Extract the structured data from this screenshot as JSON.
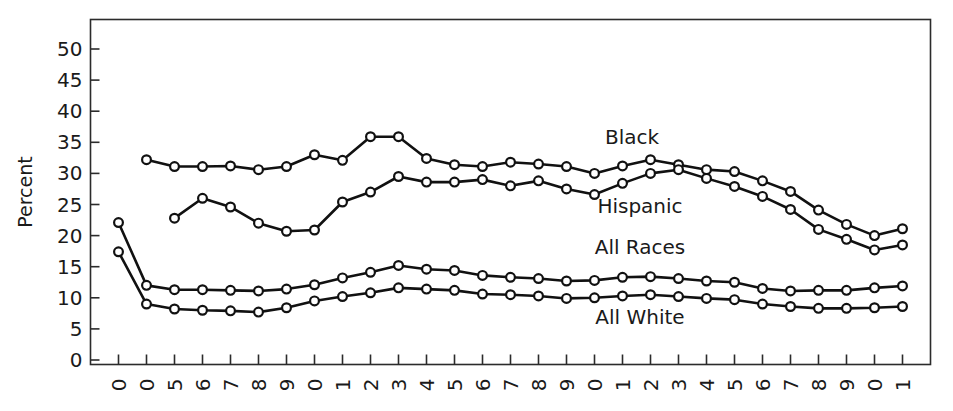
{
  "chart_data": {
    "type": "line",
    "title": "",
    "subtitle": "",
    "xlabel": "",
    "ylabel": "Percent",
    "ylim": [
      0,
      50
    ],
    "yticks": [
      0,
      5,
      10,
      15,
      20,
      25,
      30,
      35,
      40,
      45,
      50
    ],
    "ytick_labels": [
      "0",
      "5",
      "10",
      "15",
      "20",
      "25",
      "30",
      "35",
      "40",
      "45",
      "50"
    ],
    "grid": false,
    "legend_position": "inline-annotations",
    "marker": "open-circle",
    "line_color": "#111111",
    "marker_fill": "#ffffff",
    "x": [
      1959,
      1960,
      1965,
      1966,
      1967,
      1968,
      1969,
      1970,
      1971,
      1972,
      1973,
      1974,
      1975,
      1976,
      1977,
      1978,
      1979,
      1980,
      1981,
      1982,
      1983,
      1984,
      1985,
      1986,
      1987,
      1988,
      1989,
      1990,
      1991
    ],
    "xtick_labels": [
      "0",
      "0",
      "5",
      "6",
      "7",
      "8",
      "9",
      "0",
      "1",
      "2",
      "3",
      "4",
      "5",
      "6",
      "7",
      "8",
      "9",
      "0",
      "1",
      "2",
      "3",
      "4",
      "5",
      "6",
      "7",
      "8",
      "9",
      "0",
      "1"
    ],
    "series": [
      {
        "name": "Black",
        "label": "Black",
        "x": [
          1960,
          1965,
          1966,
          1967,
          1968,
          1969,
          1970,
          1971,
          1972,
          1973,
          1974,
          1975,
          1976,
          1977,
          1978,
          1979,
          1980,
          1981,
          1982,
          1983,
          1984,
          1985,
          1986,
          1987,
          1988,
          1989,
          1990,
          1991
        ],
        "values": [
          32.2,
          31.1,
          31.1,
          31.2,
          30.6,
          31.1,
          33.0,
          32.1,
          35.9,
          35.9,
          32.4,
          31.4,
          31.1,
          31.8,
          31.5,
          31.1,
          30.0,
          31.2,
          32.2,
          31.4,
          30.6,
          30.3,
          28.8,
          27.1,
          24.1,
          21.8,
          20.0,
          21.1
        ]
      },
      {
        "name": "Hispanic",
        "label": "Hispanic",
        "x": [
          1965,
          1966,
          1967,
          1968,
          1969,
          1970,
          1971,
          1972,
          1973,
          1974,
          1975,
          1976,
          1977,
          1978,
          1979,
          1980,
          1981,
          1982,
          1983,
          1984,
          1985,
          1986,
          1987,
          1988,
          1989,
          1990,
          1991
        ],
        "values": [
          22.8,
          26.0,
          24.6,
          22.0,
          20.7,
          20.9,
          25.4,
          27.0,
          29.5,
          28.6,
          28.6,
          29.0,
          28.0,
          28.8,
          27.5,
          26.6,
          28.4,
          30.0,
          30.6,
          29.2,
          27.9,
          26.3,
          24.2,
          21.0,
          19.4,
          17.7,
          18.5
        ]
      },
      {
        "name": "All Races",
        "label": "All Races",
        "x": [
          1959,
          1960,
          1965,
          1966,
          1967,
          1968,
          1969,
          1970,
          1971,
          1972,
          1973,
          1974,
          1975,
          1976,
          1977,
          1978,
          1979,
          1980,
          1981,
          1982,
          1983,
          1984,
          1985,
          1986,
          1987,
          1988,
          1989,
          1990,
          1991
        ],
        "values": [
          22.1,
          12.0,
          11.3,
          11.3,
          11.2,
          11.1,
          11.4,
          12.1,
          13.2,
          14.1,
          15.2,
          14.6,
          14.4,
          13.6,
          13.3,
          13.1,
          12.7,
          12.8,
          13.3,
          13.4,
          13.1,
          12.7,
          12.5,
          11.5,
          11.1,
          11.2,
          11.2,
          11.6,
          11.9
        ]
      },
      {
        "name": "All White",
        "label": "All White",
        "x": [
          1959,
          1960,
          1965,
          1966,
          1967,
          1968,
          1969,
          1970,
          1971,
          1972,
          1973,
          1974,
          1975,
          1976,
          1977,
          1978,
          1979,
          1980,
          1981,
          1982,
          1983,
          1984,
          1985,
          1986,
          1987,
          1988,
          1989,
          1990,
          1991
        ],
        "values": [
          17.4,
          9.0,
          8.2,
          8.0,
          7.9,
          7.7,
          8.4,
          9.5,
          10.2,
          10.8,
          11.6,
          11.4,
          11.2,
          10.6,
          10.5,
          10.3,
          9.9,
          10.0,
          10.3,
          10.5,
          10.2,
          9.9,
          9.7,
          9.0,
          8.6,
          8.3,
          8.3,
          8.4,
          8.6
        ]
      }
    ],
    "annotations": [
      {
        "text": "Black",
        "x_px": 632,
        "y_px": 144
      },
      {
        "text": "Hispanic",
        "x_px": 640,
        "y_px": 213
      },
      {
        "text": "All Races",
        "x_px": 640,
        "y_px": 254
      },
      {
        "text": "All White",
        "x_px": 640,
        "y_px": 324
      }
    ]
  }
}
